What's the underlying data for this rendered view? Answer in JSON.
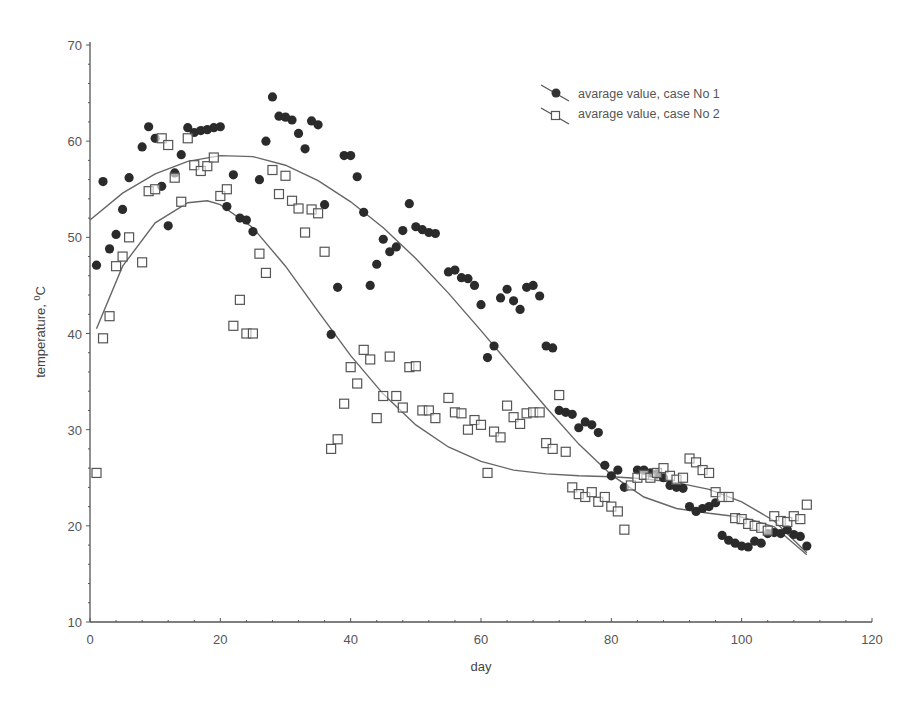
{
  "chart_data": {
    "type": "scatter",
    "title": "",
    "xlabel": "day",
    "ylabel": "temperature, ⁰C",
    "ylabel_main": "temperature, ",
    "ylabel_sup": "0",
    "ylabel_unit": "C",
    "xlim": [
      0,
      120
    ],
    "ylim": [
      10,
      70
    ],
    "x_ticks": [
      0,
      20,
      40,
      60,
      80,
      100,
      120
    ],
    "y_ticks": [
      10,
      20,
      30,
      40,
      50,
      60,
      70
    ],
    "grid": false,
    "legend_position": "top-right",
    "series": [
      {
        "name": "avarage value, case No 1",
        "marker": "filled-circle",
        "fit": "polynomial",
        "points": [
          [
            1,
            47.1
          ],
          [
            2,
            55.8
          ],
          [
            3,
            48.8
          ],
          [
            4,
            50.3
          ],
          [
            5,
            52.9
          ],
          [
            6,
            56.2
          ],
          [
            8,
            59.4
          ],
          [
            9,
            61.5
          ],
          [
            10,
            60.3
          ],
          [
            11,
            55.3
          ],
          [
            12,
            51.2
          ],
          [
            13,
            56.7
          ],
          [
            14,
            58.6
          ],
          [
            15,
            61.4
          ],
          [
            16,
            60.9
          ],
          [
            17,
            61.1
          ],
          [
            18,
            61.2
          ],
          [
            19,
            61.4
          ],
          [
            20,
            61.5
          ],
          [
            21,
            53.2
          ],
          [
            22,
            56.5
          ],
          [
            23,
            52.0
          ],
          [
            24,
            51.8
          ],
          [
            25,
            50.6
          ],
          [
            26,
            56.0
          ],
          [
            27,
            60.0
          ],
          [
            28,
            64.6
          ],
          [
            29,
            62.6
          ],
          [
            30,
            62.5
          ],
          [
            31,
            62.2
          ],
          [
            32,
            60.8
          ],
          [
            33,
            59.2
          ],
          [
            34,
            62.1
          ],
          [
            35,
            61.7
          ],
          [
            36,
            53.4
          ],
          [
            37,
            39.9
          ],
          [
            38,
            44.8
          ],
          [
            39,
            58.5
          ],
          [
            40,
            58.5
          ],
          [
            41,
            56.3
          ],
          [
            42,
            52.6
          ],
          [
            43,
            45.0
          ],
          [
            44,
            47.2
          ],
          [
            45,
            49.8
          ],
          [
            46,
            48.5
          ],
          [
            47,
            49.0
          ],
          [
            48,
            50.7
          ],
          [
            49,
            53.5
          ],
          [
            50,
            51.1
          ],
          [
            51,
            50.8
          ],
          [
            52,
            50.5
          ],
          [
            53,
            50.4
          ],
          [
            55,
            46.4
          ],
          [
            56,
            46.6
          ],
          [
            57,
            45.8
          ],
          [
            58,
            45.7
          ],
          [
            59,
            45.0
          ],
          [
            60,
            43.0
          ],
          [
            61,
            37.5
          ],
          [
            62,
            38.7
          ],
          [
            63,
            43.7
          ],
          [
            64,
            44.6
          ],
          [
            65,
            43.4
          ],
          [
            66,
            42.5
          ],
          [
            67,
            44.8
          ],
          [
            68,
            45.0
          ],
          [
            69,
            43.9
          ],
          [
            70,
            38.7
          ],
          [
            71,
            38.5
          ],
          [
            72,
            32.0
          ],
          [
            73,
            31.8
          ],
          [
            74,
            31.6
          ],
          [
            75,
            30.2
          ],
          [
            76,
            30.8
          ],
          [
            77,
            30.5
          ],
          [
            78,
            29.7
          ],
          [
            79,
            26.3
          ],
          [
            80,
            25.2
          ],
          [
            81,
            25.8
          ],
          [
            82,
            24.0
          ],
          [
            84,
            25.8
          ],
          [
            85,
            25.8
          ],
          [
            86,
            25.5
          ],
          [
            87,
            25.4
          ],
          [
            88,
            25.0
          ],
          [
            89,
            24.2
          ],
          [
            90,
            24.0
          ],
          [
            91,
            23.9
          ],
          [
            92,
            22.0
          ],
          [
            93,
            21.5
          ],
          [
            94,
            21.8
          ],
          [
            95,
            22.0
          ],
          [
            96,
            22.4
          ],
          [
            97,
            19.0
          ],
          [
            98,
            18.5
          ],
          [
            99,
            18.2
          ],
          [
            100,
            17.9
          ],
          [
            101,
            17.8
          ],
          [
            102,
            18.4
          ],
          [
            103,
            18.2
          ],
          [
            104,
            19.2
          ],
          [
            105,
            19.3
          ],
          [
            106,
            19.2
          ],
          [
            107,
            19.6
          ],
          [
            108,
            19.1
          ],
          [
            109,
            18.9
          ],
          [
            110,
            17.9
          ]
        ],
        "fit_curve": [
          [
            0,
            51.8
          ],
          [
            5,
            54.6
          ],
          [
            10,
            56.6
          ],
          [
            15,
            57.9
          ],
          [
            20,
            58.5
          ],
          [
            25,
            58.4
          ],
          [
            30,
            57.5
          ],
          [
            35,
            55.9
          ],
          [
            40,
            53.7
          ],
          [
            45,
            51.0
          ],
          [
            50,
            47.8
          ],
          [
            55,
            44.2
          ],
          [
            60,
            40.3
          ],
          [
            65,
            36.3
          ],
          [
            70,
            32.3
          ],
          [
            75,
            28.5
          ],
          [
            80,
            25.3
          ],
          [
            85,
            23.0
          ],
          [
            90,
            21.8
          ],
          [
            95,
            21.3
          ],
          [
            100,
            20.9
          ],
          [
            105,
            19.9
          ],
          [
            110,
            17.0
          ]
        ]
      },
      {
        "name": "avarage value, case No 2",
        "marker": "open-square",
        "fit": "polynomial",
        "points": [
          [
            1,
            25.5
          ],
          [
            2,
            39.5
          ],
          [
            3,
            41.8
          ],
          [
            4,
            47.0
          ],
          [
            5,
            48.0
          ],
          [
            6,
            50.0
          ],
          [
            8,
            47.4
          ],
          [
            9,
            54.8
          ],
          [
            10,
            55.0
          ],
          [
            11,
            60.3
          ],
          [
            12,
            59.6
          ],
          [
            13,
            56.2
          ],
          [
            14,
            53.7
          ],
          [
            15,
            60.3
          ],
          [
            16,
            57.5
          ],
          [
            17,
            56.9
          ],
          [
            18,
            57.4
          ],
          [
            19,
            58.3
          ],
          [
            20,
            54.3
          ],
          [
            21,
            55.0
          ],
          [
            22,
            40.8
          ],
          [
            23,
            43.5
          ],
          [
            24,
            40.0
          ],
          [
            25,
            40.0
          ],
          [
            26,
            48.3
          ],
          [
            27,
            46.3
          ],
          [
            28,
            57.0
          ],
          [
            29,
            54.5
          ],
          [
            30,
            56.4
          ],
          [
            31,
            53.8
          ],
          [
            32,
            53.0
          ],
          [
            33,
            50.5
          ],
          [
            34,
            52.9
          ],
          [
            35,
            52.5
          ],
          [
            36,
            48.5
          ],
          [
            37,
            28.0
          ],
          [
            38,
            29.0
          ],
          [
            39,
            32.7
          ],
          [
            40,
            36.5
          ],
          [
            41,
            34.8
          ],
          [
            42,
            38.3
          ],
          [
            43,
            37.3
          ],
          [
            44,
            31.2
          ],
          [
            45,
            33.5
          ],
          [
            46,
            37.6
          ],
          [
            47,
            33.5
          ],
          [
            48,
            32.3
          ],
          [
            49,
            36.5
          ],
          [
            50,
            36.6
          ],
          [
            51,
            32.0
          ],
          [
            52,
            32.0
          ],
          [
            53,
            31.2
          ],
          [
            55,
            33.3
          ],
          [
            56,
            31.8
          ],
          [
            57,
            31.7
          ],
          [
            58,
            30.0
          ],
          [
            59,
            31.0
          ],
          [
            60,
            30.5
          ],
          [
            61,
            25.5
          ],
          [
            62,
            29.8
          ],
          [
            63,
            29.2
          ],
          [
            64,
            32.5
          ],
          [
            65,
            31.3
          ],
          [
            66,
            30.6
          ],
          [
            67,
            31.7
          ],
          [
            68,
            31.8
          ],
          [
            69,
            31.8
          ],
          [
            70,
            28.6
          ],
          [
            71,
            28.0
          ],
          [
            72,
            33.6
          ],
          [
            73,
            27.7
          ],
          [
            74,
            24.0
          ],
          [
            75,
            23.3
          ],
          [
            76,
            23.0
          ],
          [
            77,
            23.5
          ],
          [
            78,
            22.5
          ],
          [
            79,
            23.0
          ],
          [
            80,
            22.0
          ],
          [
            81,
            21.5
          ],
          [
            82,
            19.6
          ],
          [
            83,
            24.2
          ],
          [
            84,
            25.0
          ],
          [
            85,
            25.3
          ],
          [
            86,
            25.0
          ],
          [
            87,
            25.5
          ],
          [
            88,
            26.0
          ],
          [
            89,
            25.2
          ],
          [
            90,
            24.8
          ],
          [
            91,
            25.0
          ],
          [
            92,
            27.0
          ],
          [
            93,
            26.6
          ],
          [
            94,
            25.8
          ],
          [
            95,
            25.5
          ],
          [
            96,
            23.5
          ],
          [
            97,
            23.0
          ],
          [
            98,
            23.0
          ],
          [
            99,
            20.8
          ],
          [
            100,
            20.7
          ],
          [
            101,
            20.2
          ],
          [
            102,
            20.0
          ],
          [
            103,
            19.8
          ],
          [
            104,
            19.5
          ],
          [
            105,
            21.0
          ],
          [
            106,
            20.5
          ],
          [
            107,
            20.4
          ],
          [
            108,
            21.0
          ],
          [
            109,
            20.7
          ],
          [
            110,
            22.2
          ]
        ],
        "fit_curve": [
          [
            1,
            40.5
          ],
          [
            5,
            47.0
          ],
          [
            10,
            51.5
          ],
          [
            15,
            53.6
          ],
          [
            18,
            53.8
          ],
          [
            20,
            53.4
          ],
          [
            25,
            51.0
          ],
          [
            30,
            47.0
          ],
          [
            35,
            42.3
          ],
          [
            40,
            37.7
          ],
          [
            45,
            33.7
          ],
          [
            50,
            30.5
          ],
          [
            55,
            28.2
          ],
          [
            60,
            26.7
          ],
          [
            65,
            25.8
          ],
          [
            70,
            25.4
          ],
          [
            75,
            25.2
          ],
          [
            80,
            25.1
          ],
          [
            85,
            24.9
          ],
          [
            90,
            24.5
          ],
          [
            95,
            23.8
          ],
          [
            100,
            22.5
          ],
          [
            105,
            20.5
          ],
          [
            110,
            17.2
          ]
        ]
      }
    ]
  }
}
